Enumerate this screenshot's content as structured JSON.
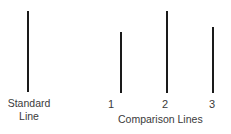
{
  "figure": {
    "background_color": "#ffffff",
    "line_color": "#1a1a1a",
    "text_color": "#3a3a3a",
    "width": 231,
    "height": 134
  },
  "standard": {
    "caption_line1": "Standard",
    "caption_line2": "Line",
    "line": {
      "x": 28,
      "top": 11,
      "bottom": 92,
      "height": 81
    }
  },
  "comparison": {
    "caption": "Comparison Lines",
    "lines": [
      {
        "label": "1",
        "x": 121,
        "top": 32,
        "bottom": 93,
        "height": 61
      },
      {
        "label": "2",
        "x": 167,
        "top": 11,
        "bottom": 93,
        "height": 82
      },
      {
        "label": "3",
        "x": 213,
        "top": 27,
        "bottom": 93,
        "height": 66
      }
    ]
  },
  "chart_data": {
    "type": "bar",
    "title": "",
    "xlabel": "",
    "ylabel": "",
    "categories": [
      "Standard Line",
      "1",
      "2",
      "3"
    ],
    "values": [
      81,
      61,
      82,
      66
    ],
    "series": [
      {
        "name": "Line length (px)",
        "values": [
          81,
          61,
          82,
          66
        ]
      }
    ],
    "annotations": [
      "Standard Line",
      "Comparison Lines"
    ],
    "grid": false,
    "legend": "none"
  }
}
